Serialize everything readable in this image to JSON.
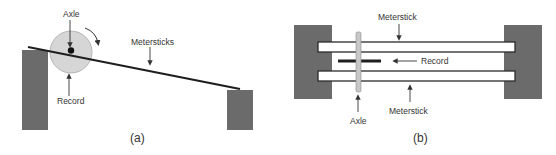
{
  "panel_a": {
    "caption": "(a)",
    "labels": {
      "axle": "Axle",
      "record": "Record",
      "metersticks": "Metersticks"
    },
    "icons": [
      "rotation-arrow-icon"
    ]
  },
  "panel_b": {
    "caption": "(b)",
    "labels": {
      "meterstick_top": "Meterstick",
      "meterstick_bottom": "Meterstick",
      "record": "Record",
      "axle": "Axle"
    }
  },
  "colors": {
    "block": "#6b6b6b",
    "record_disc": "#d6d6d6",
    "line": "#1e1e1e",
    "axle_b": "#c8c8c8",
    "text": "#333333"
  }
}
